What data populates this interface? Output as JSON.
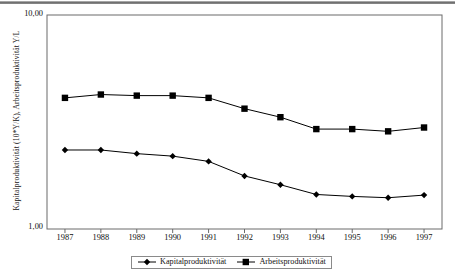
{
  "figure": {
    "background": "#ffffff",
    "axis_color": "#555555",
    "series_color": "#000000"
  },
  "axes": {
    "y_title": "Kapitalproduktivität (10*Y/K), Arbeitsproduktivität Y/L",
    "y_ticks": [
      "10,00",
      "1,00"
    ],
    "y_top_label": "10,00",
    "y_bottom_label": "1,00",
    "x_ticks": [
      "1987",
      "1988",
      "1989",
      "1990",
      "1991",
      "1992",
      "1993",
      "1994",
      "1995",
      "1996",
      "1997"
    ]
  },
  "legend": {
    "position": "bottom-center",
    "entries": [
      {
        "label": "Kapitalproduktivität",
        "marker": "diamond-marker",
        "color": "#000000"
      },
      {
        "label": "Arbeitsproduktivität",
        "marker": "square-marker",
        "color": "#000000"
      }
    ]
  },
  "chart_data": {
    "type": "line",
    "title": "",
    "subtitle": "",
    "xlabel": "",
    "ylabel": "Kapitalproduktivität (10*Y/K), Arbeitsproduktivität Y/L",
    "x": [
      "1987",
      "1988",
      "1989",
      "1990",
      "1991",
      "1992",
      "1993",
      "1994",
      "1995",
      "1996",
      "1997"
    ],
    "categories": [
      "1987",
      "1988",
      "1989",
      "1990",
      "1991",
      "1992",
      "1993",
      "1994",
      "1995",
      "1996",
      "1997"
    ],
    "y_scale": "log",
    "ylim": [
      1.0,
      10.0
    ],
    "y_tick_values": [
      1.0,
      10.0
    ],
    "y_tick_labels": [
      "1,00",
      "10,00"
    ],
    "grid": false,
    "legend_position": "bottom",
    "series": [
      {
        "name": "Kapitalproduktivität",
        "marker": "diamond",
        "color": "#000000",
        "values": [
          2.34,
          2.34,
          2.25,
          2.19,
          2.07,
          1.77,
          1.61,
          1.45,
          1.42,
          1.4,
          1.44
        ]
      },
      {
        "name": "Arbeitsproduktivität",
        "marker": "square",
        "color": "#000000",
        "values": [
          4.1,
          4.25,
          4.2,
          4.2,
          4.1,
          3.65,
          3.33,
          2.93,
          2.93,
          2.86,
          2.98
        ]
      }
    ]
  }
}
